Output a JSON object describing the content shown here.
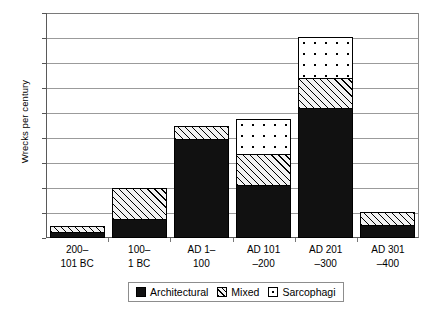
{
  "chart_data": {
    "type": "bar",
    "subtype": "stacked-bar",
    "title": "",
    "xlabel": "",
    "ylabel": "Wrecks per century",
    "ylim": [
      0,
      18
    ],
    "ytick_step": 2,
    "yticks": [
      0,
      2,
      4,
      6,
      8,
      10,
      12,
      14,
      16,
      18
    ],
    "ytick_labels": [
      "0",
      "2",
      "4",
      "6",
      "8",
      "10",
      "12",
      "14",
      "16",
      "18"
    ],
    "grid": "horizontal",
    "legend_position": "bottom-center",
    "categories": [
      "200–101 BC",
      "100–1 BC",
      "AD 1–100",
      "AD 101–200",
      "AD 201–300",
      "AD 301–400"
    ],
    "category_lines": [
      [
        "200–",
        "101 BC"
      ],
      [
        "100–",
        "1 BC"
      ],
      [
        "AD 1–",
        "100"
      ],
      [
        "AD 101",
        "–200"
      ],
      [
        "AD 201",
        "–300"
      ],
      [
        "AD 301",
        "–400"
      ]
    ],
    "series": [
      {
        "name": "Architectural",
        "fill": "solid-black",
        "color": "#111111",
        "values": [
          0.5,
          1.5,
          7.95,
          4.25,
          10.4,
          1.05
        ]
      },
      {
        "name": "Mixed",
        "fill": "diagonal-hatch",
        "color": "#f2f2f2",
        "values": [
          0.45,
          2.5,
          1.05,
          2.5,
          2.4,
          1.0
        ]
      },
      {
        "name": "Sarcophagi",
        "fill": "dotted",
        "color": "#ffffff",
        "values": [
          0,
          0,
          0,
          2.75,
          3.3,
          0
        ]
      }
    ],
    "totals": [
      0.95,
      4.0,
      9.0,
      9.5,
      16.1,
      2.05
    ]
  },
  "legend": {
    "items": [
      {
        "label": "Architectural",
        "swatch": "solid-black-swatch"
      },
      {
        "label": "Mixed",
        "swatch": "diagonal-hatch-swatch"
      },
      {
        "label": "Sarcophagi",
        "swatch": "dotted-swatch"
      }
    ]
  }
}
